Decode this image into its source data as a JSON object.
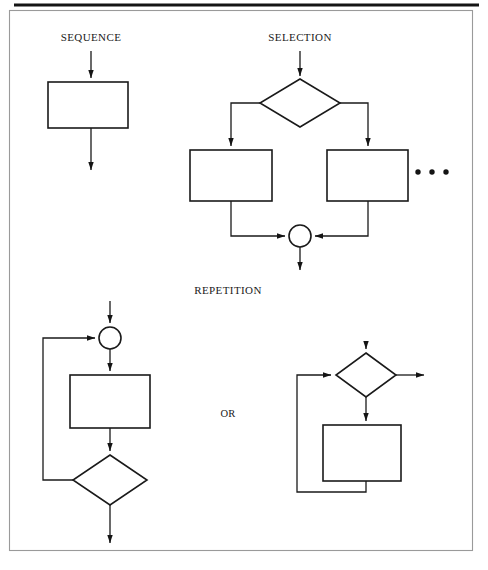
{
  "page": {
    "width": 488,
    "height": 570,
    "background": "#ffffff",
    "ink_color": "#1a1a1a",
    "frame_color": "#9a9a9a",
    "title_bar_color": "#141414"
  },
  "diagram": {
    "kind": "flowchart",
    "labels": {
      "sequence": "SEQUENCE",
      "selection": "SELECTION",
      "repetition": "REPETITION",
      "or": "OR"
    },
    "ellipsis_glyph": "•",
    "sections": [
      {
        "name": "sequence",
        "label": "SEQUENCE",
        "label_pos": {
          "x": 91,
          "y": 37
        },
        "nodes": [
          {
            "id": "seq-process",
            "type": "process",
            "x": 48,
            "y": 82,
            "w": 80,
            "h": 46
          }
        ],
        "connectors": [
          {
            "id": "seq-entry",
            "from": "top",
            "to": "seq-process",
            "points": "91,51 91,80",
            "arrow": true
          },
          {
            "id": "seq-exit",
            "from": "seq-process",
            "to": "bottom",
            "points": "91,128 91,172",
            "arrow": true
          }
        ]
      },
      {
        "name": "selection",
        "label": "SELECTION",
        "label_pos": {
          "x": 300,
          "y": 37
        },
        "nodes": [
          {
            "id": "sel-decision",
            "type": "decision",
            "cx": 300,
            "cy": 103,
            "rx": 40,
            "ry": 24
          },
          {
            "id": "sel-branch-left",
            "type": "process",
            "x": 190,
            "y": 150,
            "w": 82,
            "h": 51
          },
          {
            "id": "sel-branch-right",
            "type": "process",
            "x": 327,
            "y": 150,
            "w": 81,
            "h": 51
          },
          {
            "id": "sel-merge",
            "type": "connector-circle",
            "cx": 300,
            "cy": 236,
            "r": 11
          }
        ],
        "connectors": [
          {
            "id": "sel-entry",
            "points": "300,51 300,77",
            "arrow": true
          },
          {
            "id": "sel-left-branch",
            "points": "260,103 231,103 231,148",
            "arrow": true
          },
          {
            "id": "sel-right-branch",
            "points": "340,103 368,103 368,148",
            "arrow": true
          },
          {
            "id": "sel-left-merge",
            "points": "231,201 231,236 287,236",
            "arrow": true
          },
          {
            "id": "sel-right-merge",
            "points": "368,201 368,236 313,236",
            "arrow": true
          },
          {
            "id": "sel-exit",
            "points": "300,247 300,272",
            "arrow": true
          }
        ],
        "ellipsis": {
          "cx": [
            418,
            432,
            446
          ],
          "cy": 172,
          "r": 2.6,
          "count": 3
        }
      },
      {
        "name": "repetition",
        "label": "REPETITION",
        "label_pos": {
          "x": 228,
          "y": 290
        },
        "or_pos": {
          "x": 228,
          "y": 414
        },
        "variants": [
          {
            "name": "pre-test-loop",
            "nodes": [
              {
                "id": "rep1-merge",
                "type": "connector-circle",
                "cx": 110,
                "cy": 338,
                "r": 11
              },
              {
                "id": "rep1-body",
                "type": "process",
                "x": 70,
                "y": 375,
                "w": 80,
                "h": 53
              },
              {
                "id": "rep1-decision",
                "type": "decision",
                "cx": 110,
                "cy": 480,
                "rx": 37,
                "ry": 25
              }
            ],
            "connectors": [
              {
                "id": "rep1-entry",
                "points": "110,301 110,325",
                "arrow": true
              },
              {
                "id": "rep1-merge-to-body",
                "points": "110,349 110,373",
                "arrow": true
              },
              {
                "id": "rep1-body-to-decision",
                "points": "110,428 110,453",
                "arrow": true
              },
              {
                "id": "rep1-loopback",
                "points": "73,480 43,480 43,338 97,338",
                "arrow": true
              },
              {
                "id": "rep1-exit",
                "points": "110,505 110,545",
                "arrow": true
              }
            ]
          },
          {
            "name": "post-test-loop",
            "nodes": [
              {
                "id": "rep2-decision",
                "type": "decision",
                "cx": 366,
                "cy": 375,
                "rx": 30,
                "ry": 22
              },
              {
                "id": "rep2-body",
                "type": "process",
                "x": 323,
                "y": 425,
                "w": 78,
                "h": 56
              }
            ],
            "connectors": [
              {
                "id": "rep2-entry",
                "points": "366,342 366,351",
                "arrow": true
              },
              {
                "id": "rep2-exit-right",
                "points": "396,375 426,375",
                "arrow": true
              },
              {
                "id": "rep2-decision-to-body",
                "points": "366,397 366,423",
                "arrow": true
              },
              {
                "id": "rep2-loopback",
                "points": "366,481 366,492 297,492 297,375 333,375",
                "arrow": true
              }
            ]
          }
        ]
      }
    ]
  },
  "frame": {
    "outer": {
      "x": 9,
      "y": 10,
      "w": 464,
      "h": 541
    },
    "top_bar": {
      "x1": 14,
      "y1": 5,
      "x2": 479,
      "y2": 5
    }
  }
}
